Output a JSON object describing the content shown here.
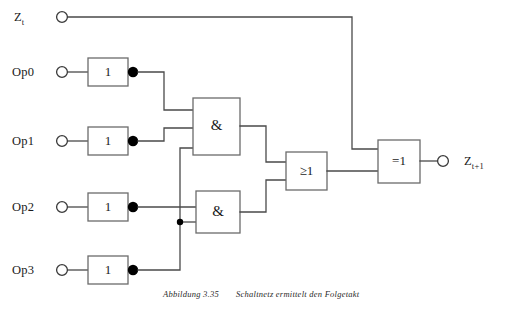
{
  "figure": {
    "caption_number": "Abbildung 3.35",
    "caption_text": "Schaltnetz ermittelt den Folgetakt"
  },
  "colors": {
    "wire": "#4a4a4a",
    "gate_border": "#6b6b6b",
    "text": "#1a1a1a",
    "background": "#ffffff",
    "dot": "#000000"
  },
  "inputs": [
    {
      "id": "zt",
      "label": "Z",
      "sub": "t",
      "terminal": "open-circle"
    },
    {
      "id": "op0",
      "label": "Op0",
      "sub": "",
      "terminal": "open-circle"
    },
    {
      "id": "op1",
      "label": "Op1",
      "sub": "",
      "terminal": "open-circle"
    },
    {
      "id": "op2",
      "label": "Op2",
      "sub": "",
      "terminal": "open-circle"
    },
    {
      "id": "op3",
      "label": "Op3",
      "sub": "",
      "terminal": "open-circle"
    }
  ],
  "outputs": [
    {
      "id": "ztp1",
      "label": "Z",
      "sub": "t+1",
      "terminal": "open-circle"
    }
  ],
  "gates": [
    {
      "id": "not0",
      "symbol": "1",
      "type": "not",
      "inverting_output": true,
      "source": "Op0"
    },
    {
      "id": "not1",
      "symbol": "1",
      "type": "not",
      "inverting_output": true,
      "source": "Op1"
    },
    {
      "id": "not2",
      "symbol": "1",
      "type": "not",
      "inverting_output": true,
      "source": "Op2"
    },
    {
      "id": "not3",
      "symbol": "1",
      "type": "not",
      "inverting_output": true,
      "source": "Op3"
    },
    {
      "id": "and1",
      "symbol": "&",
      "type": "and",
      "inverting_output": false,
      "inputs": 3
    },
    {
      "id": "and2",
      "symbol": "&",
      "type": "and",
      "inverting_output": false,
      "inputs": 2
    },
    {
      "id": "or1",
      "symbol": "≥1",
      "type": "or",
      "inverting_output": false,
      "inputs": 2
    },
    {
      "id": "xor1",
      "symbol": "=1",
      "type": "xor",
      "inverting_output": false,
      "inputs": 2
    }
  ]
}
